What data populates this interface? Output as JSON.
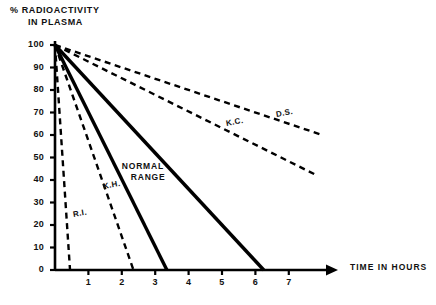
{
  "chart_data": {
    "type": "line",
    "title": "",
    "ylabel": "% RADIOACTIVITY IN PLASMA",
    "ylabel_line1": "% RADIOACTIVITY",
    "ylabel_line2": "IN PLASMA",
    "xlabel": "TIME IN HOURS",
    "xlim": [
      0,
      7.6
    ],
    "ylim": [
      0,
      100
    ],
    "grid": false,
    "legend": "inline-annotations",
    "xticks": [
      1,
      2,
      3,
      4,
      5,
      6,
      7
    ],
    "xtick_labels": [
      "1",
      "2",
      "3",
      "4",
      "5",
      "6",
      "7"
    ],
    "yticks": [
      0,
      10,
      20,
      30,
      40,
      50,
      60,
      70,
      80,
      90,
      100
    ],
    "ytick_labels": [
      "0",
      "10",
      "20",
      "30",
      "40",
      "50",
      "60",
      "70",
      "80",
      "90",
      "100"
    ],
    "series": [
      {
        "name": "R.I.",
        "label": "R.I.",
        "style": "dashed",
        "color": "#000000",
        "x": [
          0,
          0.45
        ],
        "y": [
          100,
          0
        ],
        "label_x": 0.52,
        "label_y": 25
      },
      {
        "name": "K.H.",
        "label": "K.H.",
        "style": "dashed",
        "color": "#000000",
        "x": [
          0,
          2.35
        ],
        "y": [
          100,
          0
        ],
        "label_x": 1.35,
        "label_y": 38
      },
      {
        "name": "Normal range upper bound",
        "label": "NORMAL RANGE",
        "style": "solid",
        "color": "#000000",
        "x": [
          0,
          3.35
        ],
        "y": [
          100,
          0
        ],
        "label_x": 2.0,
        "label_y": 46
      },
      {
        "name": "Normal range lower bound",
        "label": "",
        "style": "solid",
        "color": "#000000",
        "x": [
          0,
          6.25
        ],
        "y": [
          100,
          0
        ],
        "label_x": null,
        "label_y": null
      },
      {
        "name": "K.C.",
        "label": "K.C.",
        "style": "dashed",
        "color": "#000000",
        "x": [
          0,
          7.85
        ],
        "y": [
          100,
          42
        ],
        "label_x": 5.1,
        "label_y": 66
      },
      {
        "name": "D.S.",
        "label": "D.S.",
        "style": "dashed",
        "color": "#000000",
        "x": [
          0,
          8.0
        ],
        "y": [
          100,
          60
        ],
        "label_x": 6.6,
        "label_y": 70
      }
    ],
    "annotations": [
      {
        "text": "NORMAL RANGE",
        "line1": "NORMAL",
        "line2": "RANGE"
      }
    ],
    "axis_color": "#000000",
    "background": "#ffffff"
  }
}
